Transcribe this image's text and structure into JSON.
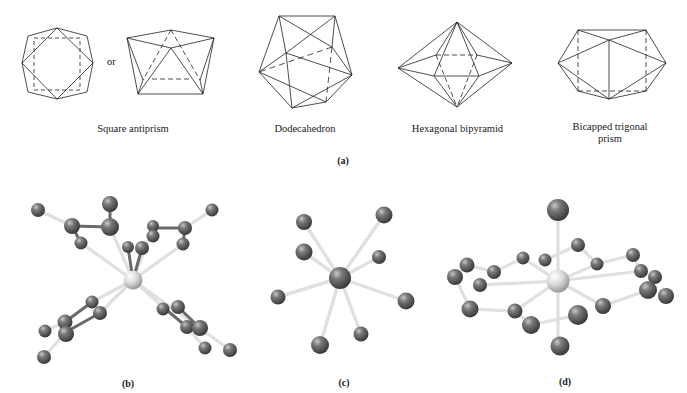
{
  "figure": {
    "panel_a": {
      "label": "(a)",
      "connector_text": "or",
      "polyhedra": [
        {
          "name": "Square antiprism",
          "label_line1": "Square antiprism",
          "label_line2": ""
        },
        {
          "name": "Dodecahedron",
          "label_line1": "Dodecahedron",
          "label_line2": ""
        },
        {
          "name": "Hexagonal bipyramid",
          "label_line1": "Hexagonal bipyramid",
          "label_line2": ""
        },
        {
          "name": "Bicapped trigonal prism",
          "label_line1": "Bicapped trigonal",
          "label_line2": "prism"
        }
      ]
    },
    "panel_b": {
      "label": "(b)",
      "description": "ball-and-stick model, central atom with two pairs of chelating rings"
    },
    "panel_c": {
      "label": "(c)",
      "description": "ball-and-stick model, central atom with 8 coordinated atoms"
    },
    "panel_d": {
      "label": "(d)",
      "description": "ball-and-stick model, central light atom with macrocyclic ring and two axial atoms"
    }
  },
  "colors": {
    "line": "#222222",
    "atom_dark": "#5a5a5a",
    "atom_center_light": "#d8d8d8",
    "bond": "#e2e2e2",
    "bond_dark": "#6a6a6a"
  }
}
